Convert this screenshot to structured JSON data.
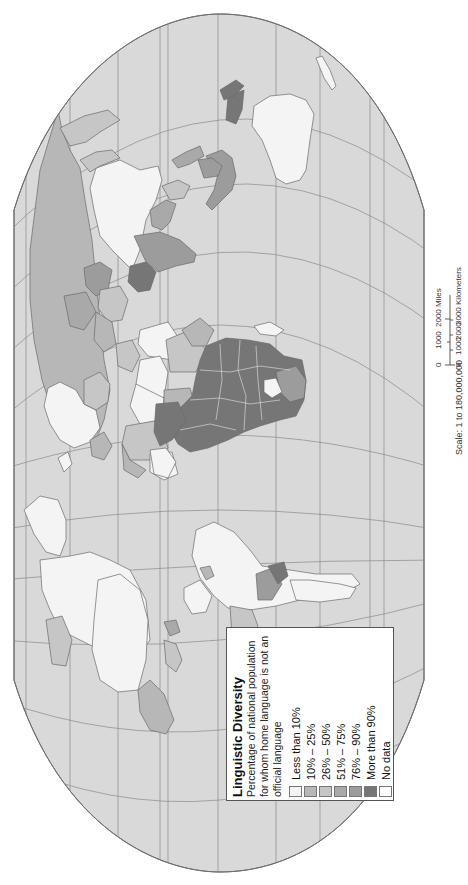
{
  "map": {
    "orientation": "rotated 90 degrees counter-clockwise (north points right)",
    "ocean_color": "#d9d9d9",
    "outline_color": "#6f6f6f"
  },
  "legend": {
    "title": "Linguistic Diversity",
    "subtitle": "Percentage of national population for whom home language is not an official language",
    "items": [
      {
        "label": "Less than 10%",
        "color": "#f4f4f4"
      },
      {
        "label": "10% – 25%",
        "color": "#b7b7b7"
      },
      {
        "label": "26% – 50%",
        "color": "#c6c6c6"
      },
      {
        "label": "51% – 75%",
        "color": "#a9a9a9"
      },
      {
        "label": "76% – 90%",
        "color": "#9c9c9c"
      },
      {
        "label": "More than 90%",
        "color": "#767676"
      },
      {
        "label": "No data",
        "color": "#ffffff"
      }
    ]
  },
  "scale": {
    "text": "Scale: 1 to 180,000,000",
    "miles_ticks": [
      "0",
      "1000",
      "2000 Miles"
    ],
    "km_ticks": [
      "0",
      "1000",
      "2000",
      "3000 Kilometers"
    ]
  }
}
